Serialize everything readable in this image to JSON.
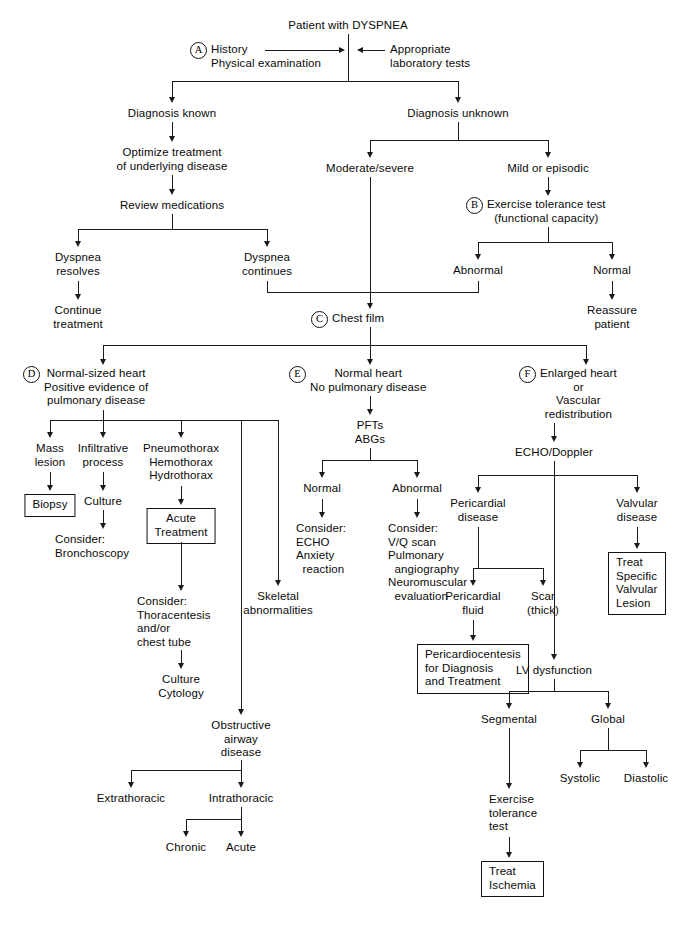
{
  "diagram": {
    "title": "Patient with DYSPNEA",
    "type": "clinical-decision-flowchart",
    "step_markers": [
      "A",
      "B",
      "C",
      "D",
      "E",
      "F"
    ],
    "line_color": "#1a1a1a",
    "background": "#ffffff"
  },
  "nodes": {
    "root": "Patient with DYSPNEA",
    "a_history": "History\nPhysical examination",
    "a_labs": "Appropriate\nlaboratory tests",
    "dx_known": "Diagnosis known",
    "dx_unknown": "Diagnosis unknown",
    "optimize": "Optimize treatment\nof underlying disease",
    "review_meds": "Review medications",
    "moderate_severe": "Moderate/severe",
    "mild_episodic": "Mild or episodic",
    "b_ett": "Exercise tolerance test\n(functional capacity)",
    "dyspnea_resolves": "Dyspnea\nresolves",
    "dyspnea_continues": "Dyspnea\ncontinues",
    "abnormal_b": "Abnormal",
    "normal_b": "Normal",
    "continue_treatment": "Continue\ntreatment",
    "reassure": "Reassure\npatient",
    "c_chest_film": "Chest film",
    "d_head": "Normal-sized heart\nPositive evidence of\npulmonary disease",
    "e_head": "Normal heart\nNo pulmonary disease",
    "f_head": "Enlarged heart\nor\nVascular\nredistribution",
    "mass_lesion": "Mass\nlesion",
    "infiltrative": "Infiltrative\nprocess",
    "pneumothorax": "Pneumothorax\nHemothorax\nHydrothorax",
    "biopsy": "Biopsy",
    "culture": "Culture",
    "acute_treatment": "Acute\nTreatment",
    "consider_bronch": "Consider:\nBronchoscopy",
    "consider_thora": "Consider:\nThoracentesis\nand/or\nchest tube",
    "culture_cytology": "Culture\nCytology",
    "skeletal": "Skeletal\nabnormalities",
    "obstructive": "Obstructive\nairway\ndisease",
    "extrathoracic": "Extrathoracic",
    "intrathoracic": "Intrathoracic",
    "chronic": "Chronic",
    "acute": "Acute",
    "pfts_abgs": "PFTs\nABGs",
    "normal_e": "Normal",
    "abnormal_e": "Abnormal",
    "consider_echo": "Consider:\nECHO\nAnxiety\n  reaction",
    "consider_vq": "Consider:\nV/Q scan\nPulmonary\n  angiography\nNeuromuscular\n  evaluation",
    "echo_doppler": "ECHO/Doppler",
    "pericardial_disease": "Pericardial\ndisease",
    "valvular_disease": "Valvular\ndisease",
    "pericardial_fluid": "Pericardial\nfluid",
    "scar_thick": "Scar\n(thick)",
    "pericardiocentesis": "Pericardiocentesis\nfor Diagnosis\nand Treatment",
    "treat_valvular": "Treat\nSpecific\nValvular\nLesion",
    "lv_dysfunction": "LV dysfunction",
    "segmental": "Segmental",
    "global": "Global",
    "systolic": "Systolic",
    "diastolic": "Diastolic",
    "exercise_tolerance_test": "Exercise\ntolerance\ntest",
    "treat_ischemia": "Treat\nIschemia"
  },
  "markers": {
    "a": "A",
    "b": "B",
    "c": "C",
    "d": "D",
    "e": "E",
    "f": "F"
  }
}
